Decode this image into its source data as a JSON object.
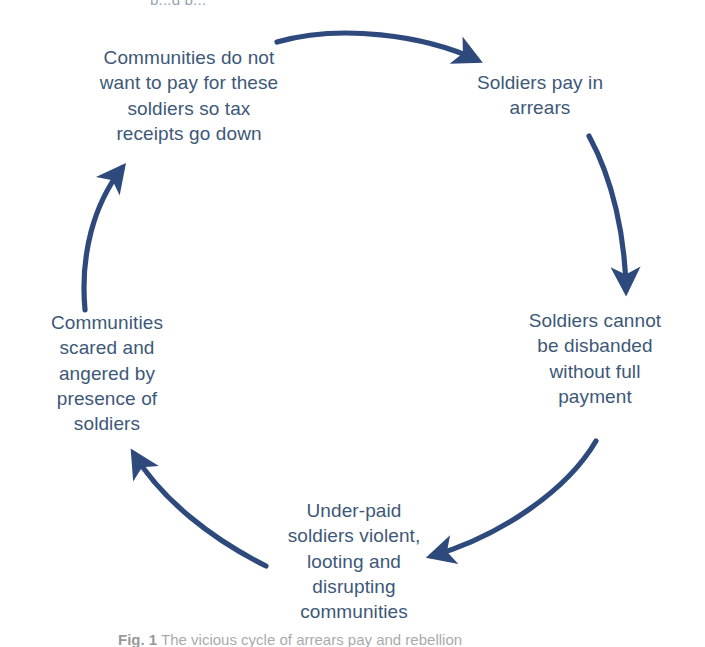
{
  "figure": {
    "title_clipped_top": "p...g p...",
    "background_color": "#ffffff",
    "arrow_color": "#2e4a7d",
    "text_color": "#3d5878",
    "caption_label": "Fig. 1",
    "caption_text": "The vicious cycle of arrears pay and rebellion",
    "type": "cyclical-flow-diagram",
    "node_count": 5,
    "arrow_count": 5,
    "direction": "clockwise"
  },
  "nodes": [
    {
      "id": "communities-tax",
      "position": "top-left",
      "text": "Communities do not\nwant to pay for these\nsoldiers so tax\nreceipts go down"
    },
    {
      "id": "soldiers-arrears",
      "position": "top-right",
      "text": "Soldiers pay in\narrears"
    },
    {
      "id": "cannot-disband",
      "position": "right",
      "text": "Soldiers cannot\nbe disbanded\nwithout full\npayment"
    },
    {
      "id": "underpaid-violent",
      "position": "bottom",
      "text": "Under-paid\nsoldiers violent,\nlooting and\ndisrupting\ncommunities"
    },
    {
      "id": "communities-scared",
      "position": "left",
      "text": "Communities\nscared and\nangered by\npresence of\nsoldiers"
    }
  ],
  "arrows": [
    {
      "id": "arrow-top",
      "from": "communities-tax",
      "to": "soldiers-arrears"
    },
    {
      "id": "arrow-right",
      "from": "soldiers-arrears",
      "to": "cannot-disband"
    },
    {
      "id": "arrow-bottom-right",
      "from": "cannot-disband",
      "to": "underpaid-violent"
    },
    {
      "id": "arrow-bottom-left",
      "from": "underpaid-violent",
      "to": "communities-scared"
    },
    {
      "id": "arrow-left",
      "from": "communities-scared",
      "to": "communities-tax"
    }
  ]
}
